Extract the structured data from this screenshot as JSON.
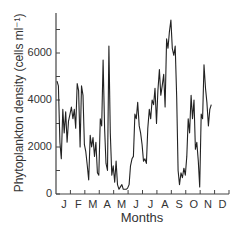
{
  "chart_data": {
    "type": "line",
    "title": "",
    "xlabel": "Months",
    "ylabel": "Phytoplankton density (cells ml⁻¹)",
    "ylim": [
      0,
      7600
    ],
    "yticks": [
      0,
      2000,
      4000,
      6000
    ],
    "yticks_minor": [
      1000,
      3000,
      5000,
      7000
    ],
    "xtick_labels": [
      "J",
      "F",
      "M",
      "A",
      "M",
      "J",
      "J",
      "A",
      "S",
      "O",
      "N",
      "D"
    ],
    "grid": false,
    "legend": null,
    "series": [
      {
        "name": "Phytoplankton density",
        "x_month_fraction": [
          0.0,
          0.1,
          0.2,
          0.3,
          0.4,
          0.5,
          0.6,
          0.7,
          0.8,
          0.9,
          1.0,
          1.1,
          1.2,
          1.3,
          1.4,
          1.5,
          1.6,
          1.7,
          1.8,
          1.9,
          2.0,
          2.1,
          2.2,
          2.3,
          2.4,
          2.5,
          2.6,
          2.7,
          2.8,
          2.9,
          3.0,
          3.1,
          3.2,
          3.3,
          3.4,
          3.5,
          3.6,
          3.7,
          3.8,
          3.9,
          4.0,
          4.1,
          4.2,
          4.3,
          4.4,
          4.5,
          4.6,
          4.7,
          4.8,
          4.9,
          5.0,
          5.1,
          5.2,
          5.3,
          5.4,
          5.5,
          5.6,
          5.7,
          5.8,
          5.9,
          6.0,
          6.1,
          6.2,
          6.3,
          6.4,
          6.5,
          6.6,
          6.7,
          6.8,
          6.9,
          7.0,
          7.1,
          7.2,
          7.3,
          7.4,
          7.5,
          7.6,
          7.7,
          7.8,
          7.9,
          8.0,
          8.1,
          8.2,
          8.3,
          8.4,
          8.5,
          8.6,
          8.7,
          8.8,
          8.9,
          9.0,
          9.1,
          9.2,
          9.3,
          9.4,
          9.5,
          9.6,
          9.7,
          9.8,
          9.9,
          10.0,
          10.1,
          10.2,
          10.3,
          10.4,
          10.5,
          10.6,
          10.7,
          10.8,
          10.9,
          11.0,
          11.1,
          11.2,
          11.3,
          11.4,
          11.5,
          11.6,
          11.7
        ],
        "values": [
          4800,
          4600,
          2200,
          1500,
          3600,
          2600,
          3500,
          2200,
          3100,
          3400,
          3700,
          3200,
          3600,
          2800,
          4700,
          4400,
          2000,
          4600,
          4200,
          2100,
          1800,
          1200,
          600,
          2500,
          2000,
          2400,
          1600,
          2200,
          900,
          800,
          3200,
          2900,
          5700,
          2800,
          1300,
          1000,
          6300,
          2600,
          800,
          1200,
          500,
          1400,
          400,
          200,
          300,
          400,
          200,
          200,
          200,
          250,
          400,
          1200,
          1500,
          1600,
          3400,
          3200,
          3900,
          2900,
          2600,
          2100,
          1400,
          1500,
          1300,
          2800,
          3600,
          3200,
          4000,
          3800,
          4500,
          3000,
          4400,
          5300,
          4200,
          4600,
          5100,
          3700,
          6600,
          6200,
          6900,
          7400,
          6200,
          5900,
          6300,
          4100,
          1000,
          400,
          900,
          700,
          1100,
          800,
          1600,
          3200,
          2600,
          4200,
          3200,
          4000,
          1900,
          2200,
          1400,
          300,
          3400,
          3200,
          5500,
          4500,
          3900,
          2900,
          3600,
          3800
        ],
        "note": "values estimated from pixel positions; axis ~23.5px per 1000 cells ml-1"
      }
    ]
  },
  "labels": {
    "y0": "0",
    "y2000": "2000",
    "y4000": "4000",
    "y6000": "6000",
    "xlabel": "Months",
    "ylabel": "Phytoplankton density (cells ml⁻¹)"
  }
}
